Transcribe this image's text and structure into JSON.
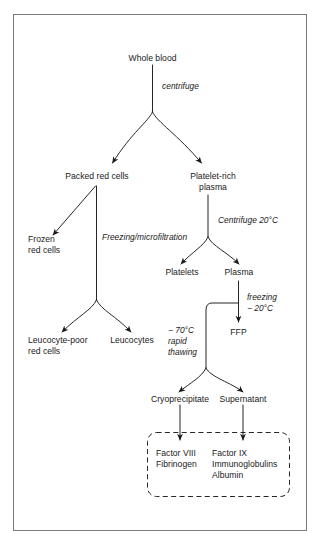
{
  "diagram": {
    "border_color": "#7a7a7a",
    "line_color": "#1a1a1a",
    "text_color": "#1a1a1a",
    "nodes": {
      "whole_blood": "Whole blood",
      "packed_red_cells": "Packed red cells",
      "platelet_rich_plasma_l1": "Platelet-rich",
      "platelet_rich_plasma_l2": "plasma",
      "frozen_red_cells_l1": "Frozen",
      "frozen_red_cells_l2": "red cells",
      "platelets": "Platelets",
      "plasma": "Plasma",
      "leucocyte_poor_l1": "Leucocyte-poor",
      "leucocyte_poor_l2": "red cells",
      "leucocytes": "Leucocytes",
      "ffp": "FFP",
      "cryoprecipitate": "Cryoprecipitate",
      "supernatant": "Supernatant"
    },
    "process_labels": {
      "centrifuge": "centrifuge",
      "freezing_microfiltration": "Freezing/microfiltration",
      "centrifuge_20c": "Centrifuge 20°C",
      "freezing_l1": "freezing",
      "freezing_l2": "− 20°C",
      "thawing_l1": "− 70°C",
      "thawing_l2": "rapid",
      "thawing_l3": "thawing"
    },
    "products_box": {
      "left_column": {
        "line1": "Factor VIII",
        "line2": "Fibrinogen"
      },
      "right_column": {
        "line1": "Factor IX",
        "line2": "Immunoglobulins",
        "line3": "Albumin"
      }
    }
  }
}
